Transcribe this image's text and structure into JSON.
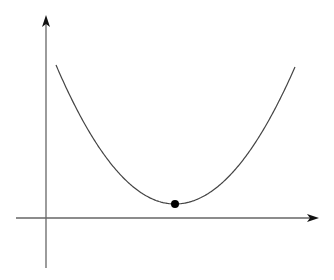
{
  "diagram": {
    "type": "parabola-sketch",
    "colors": {
      "background": "#ffffff",
      "axis": "#555555",
      "curve": "#444444",
      "point": "#000000"
    },
    "axes": {
      "x_axis": {
        "y": 218,
        "x_start": 16,
        "x_end": 318,
        "arrow": "right"
      },
      "y_axis": {
        "x": 46,
        "y_start": 268,
        "y_end": 16,
        "arrow": "up"
      }
    },
    "curve": {
      "start": [
        56,
        65
      ],
      "vertex": [
        175,
        204
      ],
      "end": [
        295,
        67
      ]
    },
    "point": {
      "label": "minimum-point",
      "cx": 175,
      "cy": 204,
      "r": 4
    }
  }
}
